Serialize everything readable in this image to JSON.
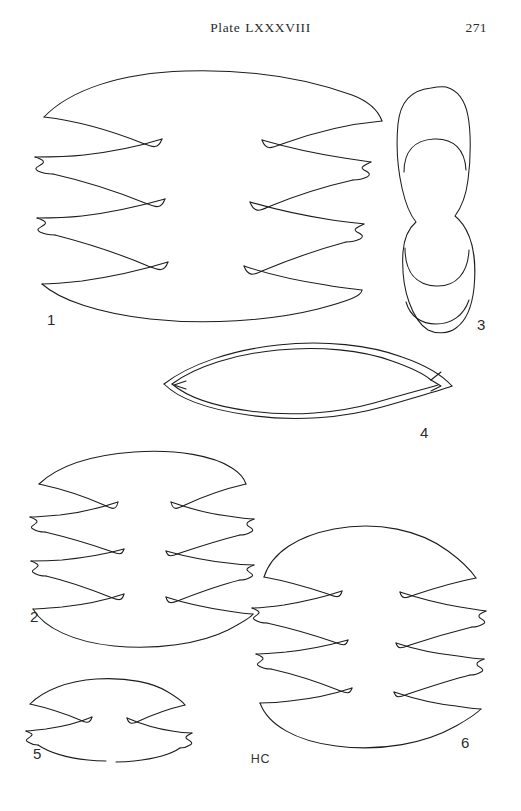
{
  "page": {
    "plate_title": "Plate LXXXVIII",
    "title_word": "Plate",
    "title_numeral": "LXXXVIII",
    "page_number": "271",
    "artist_monogram": "HC",
    "background_color": "#ffffff",
    "ink_color": "#1c1c1c",
    "width": 521,
    "height": 811
  },
  "figures": [
    {
      "id": "figure-1",
      "label": "1",
      "label_x": 47,
      "label_y": 325,
      "description": "large bilaterally symmetric lobed valve outline with four spined lateral lobes per side",
      "lobe_pairs": 4
    },
    {
      "id": "figure-2",
      "label": "2",
      "label_x": 30,
      "label_y": 622,
      "description": "bilaterally symmetric lobed valve outline with four spined lateral lobes per side",
      "lobe_pairs": 4
    },
    {
      "id": "figure-3",
      "label": "3",
      "label_x": 477,
      "label_y": 330,
      "description": "vertical hourglass or peanut shaped outline with nested inner contour arcs",
      "lobe_pairs": 0
    },
    {
      "id": "figure-4",
      "label": "4",
      "label_x": 420,
      "label_y": 438,
      "description": "horizontal lenticular leaf shaped outline with pointed notched tips",
      "lobe_pairs": 0
    },
    {
      "id": "figure-5",
      "label": "5",
      "label_x": 33,
      "label_y": 759,
      "description": "small bilaterally symmetric lobed outline with two spined lateral lobes per side",
      "lobe_pairs": 2
    },
    {
      "id": "figure-6",
      "label": "6",
      "label_x": 461,
      "label_y": 748,
      "description": "rounded bilaterally symmetric lobed valve outline with three spined lateral lobes per side",
      "lobe_pairs": 3
    }
  ]
}
